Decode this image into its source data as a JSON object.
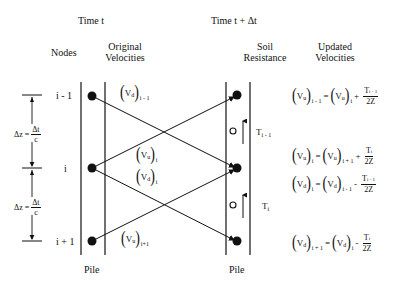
{
  "headers": {
    "time_left": "Time  t",
    "time_right": "Time  t + Δt",
    "nodes": "Nodes",
    "original_velocities_line1": "Original",
    "original_velocities_line2": "Velocities",
    "soil_resistance_line1": "Soil",
    "soil_resistance_line2": "Resistance",
    "updated_velocities_line1": "Updated",
    "updated_velocities_line2": "Velocities"
  },
  "nodes": {
    "top": "i - 1",
    "middle": "i",
    "bottom": "i + 1"
  },
  "spacing": {
    "label": "Δz =",
    "numerator": "Δt",
    "denominator": "c"
  },
  "pile_labels": {
    "left": "Pile",
    "right": "Pile"
  },
  "original_velocities": [
    {
      "v": "V",
      "sub_v": "d",
      "sub": "i - 1"
    },
    {
      "v": "V",
      "sub_v": "u",
      "sub": "i"
    },
    {
      "v": "V",
      "sub_v": "d",
      "sub": "i"
    },
    {
      "v": "V",
      "sub_v": "u",
      "sub": "i+1"
    }
  ],
  "soil_resistance": [
    {
      "symbol": "O",
      "label": "T",
      "sub": "i - 1"
    },
    {
      "symbol": "O",
      "label": "T",
      "sub": "i"
    }
  ],
  "equations": [
    {
      "lhs": "V",
      "lhs_v": "u",
      "lhs_sub": "i - 1",
      "rhs": "V",
      "rhs_v": "u",
      "rhs_sub": "i",
      "op": "+",
      "num": "T",
      "num_sub": "i - 1",
      "den": "2Z"
    },
    {
      "lhs": "V",
      "lhs_v": "u",
      "lhs_sub": "i",
      "rhs": "V",
      "rhs_v": "u",
      "rhs_sub": "i + 1",
      "op": "+",
      "num": "T",
      "num_sub": "i",
      "den": "2Z"
    },
    {
      "lhs": "V",
      "lhs_v": "d",
      "lhs_sub": "i",
      "rhs": "V",
      "rhs_v": "d",
      "rhs_sub": "i - 1",
      "op": "-",
      "num": "T",
      "num_sub": "i - 1",
      "den": "2Z"
    },
    {
      "lhs": "V",
      "lhs_v": "d",
      "lhs_sub": "i + 1",
      "rhs": "V",
      "rhs_v": "d",
      "rhs_sub": "i",
      "op": "-",
      "num": "T",
      "num_sub": "i",
      "den": "2Z"
    }
  ],
  "symbols": {
    "equals": "="
  }
}
